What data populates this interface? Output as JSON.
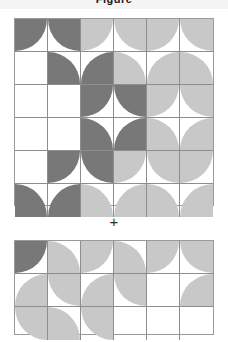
{
  "header": {
    "title_partial": "Figure"
  },
  "operator": {
    "symbol": "+"
  },
  "colors": {
    "dark": "#787878",
    "light": "#c8c8c8",
    "empty": "#ffffff",
    "grid_line": "#8e8e8e",
    "outer_border": "#9a9a9a",
    "page_background": "#ffffff",
    "header_background": "#f4f4f4",
    "text": "#1a1a1a"
  },
  "diagram": {
    "type": "quarter-circle-tile-grid",
    "cell_size": 33,
    "arc_orientations": [
      "tl",
      "tr",
      "bl",
      "br"
    ],
    "fill_legend": {
      "d": "dark",
      "l": "light",
      "e": "empty"
    },
    "grids": [
      {
        "name": "top-grid",
        "cols": 6,
        "rows": 6,
        "width": 198,
        "height": 186,
        "cells": [
          [
            {
              "arc": "tl",
              "fill": "d"
            },
            {
              "arc": "tr",
              "fill": "d"
            },
            {
              "arc": "tl",
              "fill": "l"
            },
            {
              "arc": "tr",
              "fill": "l"
            },
            {
              "arc": "tl",
              "fill": "l"
            },
            {
              "arc": "tr",
              "fill": "l"
            }
          ],
          [
            {
              "arc": "tl",
              "fill": "e"
            },
            {
              "arc": "bl",
              "fill": "d"
            },
            {
              "arc": "br",
              "fill": "d"
            },
            {
              "arc": "bl",
              "fill": "l"
            },
            {
              "arc": "br",
              "fill": "l"
            },
            {
              "arc": "bl",
              "fill": "l"
            }
          ],
          [
            {
              "arc": "tl",
              "fill": "e"
            },
            {
              "arc": "tl",
              "fill": "e"
            },
            {
              "arc": "tl",
              "fill": "d"
            },
            {
              "arc": "tr",
              "fill": "d"
            },
            {
              "arc": "tl",
              "fill": "l"
            },
            {
              "arc": "tr",
              "fill": "l"
            }
          ],
          [
            {
              "arc": "tl",
              "fill": "e"
            },
            {
              "arc": "tl",
              "fill": "e"
            },
            {
              "arc": "bl",
              "fill": "d"
            },
            {
              "arc": "br",
              "fill": "d"
            },
            {
              "arc": "bl",
              "fill": "l"
            },
            {
              "arc": "br",
              "fill": "l"
            }
          ],
          [
            {
              "arc": "tl",
              "fill": "e"
            },
            {
              "arc": "tl",
              "fill": "d"
            },
            {
              "arc": "tr",
              "fill": "d"
            },
            {
              "arc": "tl",
              "fill": "l"
            },
            {
              "arc": "tr",
              "fill": "l"
            },
            {
              "arc": "tl",
              "fill": "l"
            }
          ],
          [
            {
              "arc": "bl",
              "fill": "d"
            },
            {
              "arc": "br",
              "fill": "d"
            },
            {
              "arc": "bl",
              "fill": "l"
            },
            {
              "arc": "br",
              "fill": "l"
            },
            {
              "arc": "bl",
              "fill": "l"
            },
            {
              "arc": "br",
              "fill": "l"
            }
          ]
        ]
      },
      {
        "name": "bottom-grid",
        "cols": 6,
        "rows": 3,
        "width": 198,
        "height": 93,
        "cells": [
          [
            {
              "arc": "tl",
              "fill": "d"
            },
            {
              "arc": "bl",
              "fill": "l"
            },
            {
              "arc": "tl",
              "fill": "l"
            },
            {
              "arc": "bl",
              "fill": "l"
            },
            {
              "arc": "tl",
              "fill": "l"
            },
            {
              "arc": "tr",
              "fill": "l"
            }
          ],
          [
            {
              "arc": "br",
              "fill": "l"
            },
            {
              "arc": "tr",
              "fill": "l"
            },
            {
              "arc": "br",
              "fill": "l"
            },
            {
              "arc": "tr",
              "fill": "l"
            },
            {
              "arc": "tl",
              "fill": "e"
            },
            {
              "arc": "br",
              "fill": "l"
            }
          ],
          [
            {
              "arc": "tr",
              "fill": "l"
            },
            {
              "arc": "bl",
              "fill": "l"
            },
            {
              "arc": "tr",
              "fill": "l"
            },
            {
              "arc": "tl",
              "fill": "e"
            },
            {
              "arc": "tl",
              "fill": "e"
            },
            {
              "arc": "tl",
              "fill": "e"
            }
          ]
        ]
      }
    ]
  }
}
